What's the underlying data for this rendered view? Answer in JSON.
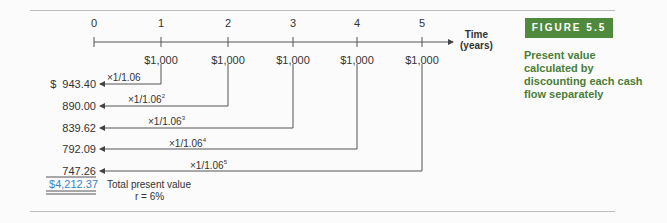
{
  "figure": {
    "badge": "FIGURE 5.5",
    "caption": "Present value calculated by discounting each cash flow separately",
    "accent_color": "#4f8a3c"
  },
  "timeline": {
    "ticks": [
      "0",
      "1",
      "2",
      "3",
      "4",
      "5"
    ],
    "axis_label_line1": "Time",
    "axis_label_line2": "(years)",
    "cash_flows": [
      "$1,000",
      "$1,000",
      "$1,000",
      "$1,000",
      "$1,000"
    ]
  },
  "discounting": [
    {
      "pv": "$  943.40",
      "factor": "×1/1.06",
      "exp": ""
    },
    {
      "pv": "890.00",
      "factor": "×1/1.06",
      "exp": "2"
    },
    {
      "pv": "839.62",
      "factor": "×1/1.06",
      "exp": "3"
    },
    {
      "pv": "792.09",
      "factor": "×1/1.06",
      "exp": "4"
    },
    {
      "pv": "747.26",
      "factor": "×1/1.06",
      "exp": "5"
    }
  ],
  "total": {
    "value": "$4,212.37",
    "label": "Total present value",
    "rate": "r = 6%"
  }
}
